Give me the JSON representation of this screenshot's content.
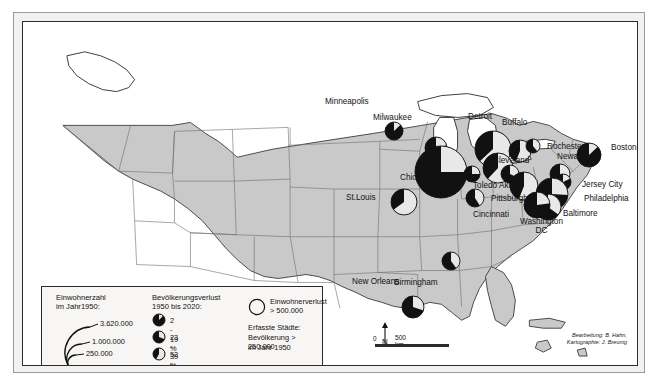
{
  "map": {
    "title": "Bevölkerungsverlust US-Städte 1950-2020",
    "background_land": "#c9c9c9",
    "background_water": "#ffffff",
    "pie_dark": "#111111",
    "pie_light": "#e8e8e8",
    "pie_mid": "#8c8c8c"
  },
  "legend": {
    "size": {
      "title_line1": "Einwohnerzahl",
      "title_line2": "im Jahr1950:",
      "values": [
        "3.620.000",
        "1.000.000",
        "250.000"
      ]
    },
    "loss": {
      "title_line1": "Bevölkerungsverlust",
      "title_line2": "1950 bis 2020:",
      "classes": [
        {
          "label": "2 - 19 %",
          "pct": 12
        },
        {
          "label": "23 - 39 %",
          "pct": 31
        },
        {
          "label": "52 - 65 %",
          "pct": 58
        }
      ]
    },
    "absolute": {
      "line1": "Einwohnerverlust",
      "line2": "> 500.000"
    },
    "note": {
      "line1": "Erfasste Städte:",
      "line2": "Bevölkerung > 250.000",
      "line3": "im Jahr 1950"
    }
  },
  "scale": {
    "zero": "0",
    "label": "500 km",
    "north": "N"
  },
  "attribution": {
    "line1": "Bearbeitung: B. Hahn,",
    "line2": "Kartographie: J. Breunig"
  },
  "cities": [
    {
      "name": "Minneapolis",
      "x": 338,
      "y": 88,
      "cx": 371,
      "cy": 109,
      "r": 9,
      "loss": 13,
      "label_dx": -36,
      "label_dy": -12
    },
    {
      "name": "Milwaukee",
      "x": 384,
      "y": 105,
      "cx": 413,
      "cy": 126,
      "r": 11,
      "loss": 21,
      "label_dx": -34,
      "label_dy": -13
    },
    {
      "name": "Chicago",
      "x": 399,
      "y": 148,
      "cx": 418,
      "cy": 150,
      "r": 26,
      "loss": 25,
      "label_dx": -22,
      "label_dy": 4
    },
    {
      "name": "Detroit",
      "x": 462,
      "y": 104,
      "cx": 470,
      "cy": 127,
      "r": 18,
      "loss": 63,
      "label_dx": -17,
      "label_dy": -13
    },
    {
      "name": "Buffalo",
      "x": 496,
      "y": 109,
      "cx": 497,
      "cy": 129,
      "r": 11,
      "loss": 56,
      "label_dx": -17,
      "label_dy": -12
    },
    {
      "name": "Rochester",
      "x": 516,
      "y": 123,
      "cx": 510,
      "cy": 124,
      "r": 7,
      "loss": 39,
      "label_dx": 8,
      "label_dy": -2
    },
    {
      "name": "Boston",
      "x": 576,
      "y": 126,
      "cx": 566,
      "cy": 133,
      "r": 12,
      "loss": 13,
      "label_dx": 12,
      "label_dy": -4
    },
    {
      "name": "Cleveland",
      "x": 468,
      "y": 139,
      "cx": 475,
      "cy": 146,
      "r": 15,
      "loss": 62,
      "label_dx": 2,
      "label_dy": -4
    },
    {
      "name": "Newark",
      "x": 529,
      "y": 139,
      "cx": 537,
      "cy": 152,
      "r": 10,
      "loss": 37,
      "label_dx": 5,
      "label_dy": -8
    },
    {
      "name": "Toledo",
      "x": 448,
      "y": 158,
      "cx": 449,
      "cy": 152,
      "r": 8,
      "loss": 25,
      "label_dx": 2,
      "label_dy": 2
    },
    {
      "name": "Akron",
      "x": 478,
      "y": 158,
      "cx": 487,
      "cy": 152,
      "r": 9,
      "loss": 32,
      "label_dx": -2,
      "label_dy": 2
    },
    {
      "name": "Pittsburgh",
      "x": 485,
      "y": 170,
      "cx": 501,
      "cy": 164,
      "r": 14,
      "loss": 56,
      "label_dx": -17,
      "label_dy": 3
    },
    {
      "name": "Jersey City",
      "x": 549,
      "y": 160,
      "cx": 540,
      "cy": 160,
      "r": 8,
      "loss": 18,
      "label_dx": 10,
      "label_dy": -1
    },
    {
      "name": "Philadelphia",
      "x": 551,
      "y": 173,
      "cx": 529,
      "cy": 172,
      "r": 16,
      "loss": 26,
      "label_dx": 10,
      "label_dy": 0
    },
    {
      "name": "Baltimore",
      "x": 531,
      "y": 188,
      "cx": 525,
      "cy": 185,
      "r": 13,
      "loss": 35,
      "label_dx": 9,
      "label_dy": 0
    },
    {
      "name": "Washington DC",
      "x": 513,
      "y": 190,
      "cx": 514,
      "cy": 183,
      "r": 13,
      "loss": 23,
      "label_dx": -16,
      "label_dy": 6
    },
    {
      "name": "Cincinnati",
      "x": 452,
      "y": 185,
      "cx": 452,
      "cy": 176,
      "r": 9,
      "loss": 41,
      "label_dx": -2,
      "label_dy": 4
    },
    {
      "name": "St.Louis",
      "x": 351,
      "y": 174,
      "cx": 381,
      "cy": 180,
      "r": 13,
      "loss": 65,
      "label_dx": -28,
      "label_dy": -2
    },
    {
      "name": "Birmingham",
      "x": 403,
      "y": 251,
      "cx": 428,
      "cy": 239,
      "r": 9,
      "loss": 40,
      "label_dx": -32,
      "label_dy": 6
    },
    {
      "name": "New Orleans",
      "x": 367,
      "y": 268,
      "cx": 390,
      "cy": 285,
      "r": 11,
      "loss": 30,
      "label_dx": -38,
      "label_dy": -12
    }
  ]
}
